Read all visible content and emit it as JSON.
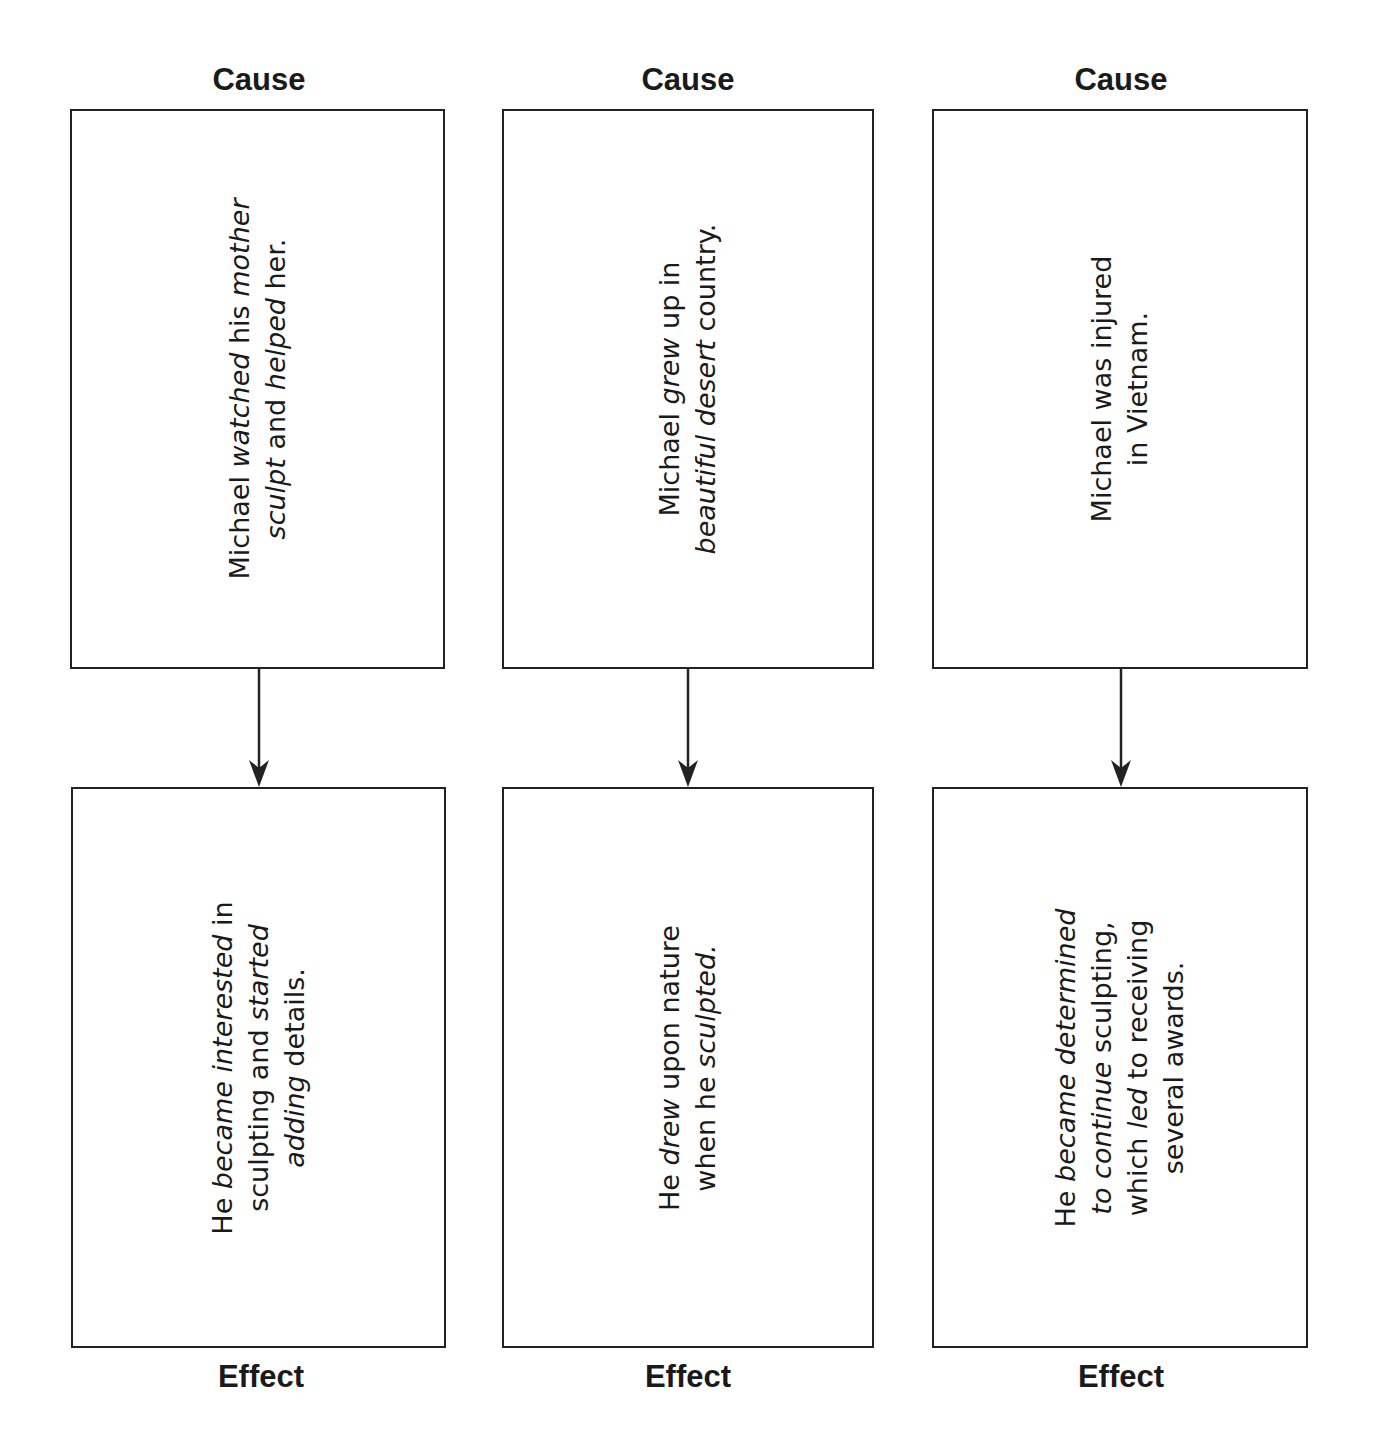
{
  "diagram": {
    "type": "cause-effect-chart",
    "columns": [
      {
        "cause_label": "Cause",
        "effect_label": "Effect",
        "cause": {
          "lines": [
            [
              {
                "t": "Michael "
              },
              {
                "t": "watched",
                "i": true
              },
              {
                "t": " his "
              },
              {
                "t": "mother",
                "i": true
              }
            ],
            [
              {
                "t": "sculpt",
                "i": true
              },
              {
                "t": " and "
              },
              {
                "t": "helped",
                "i": true
              },
              {
                "t": " her."
              }
            ]
          ],
          "text": "Michael watched his mother sculpt and helped her."
        },
        "effect": {
          "lines": [
            [
              {
                "t": "He "
              },
              {
                "t": "became",
                "i": true
              },
              {
                "t": " "
              },
              {
                "t": "interested",
                "i": true
              },
              {
                "t": " in"
              }
            ],
            [
              {
                "t": "sculpting and "
              },
              {
                "t": "started",
                "i": true
              }
            ],
            [
              {
                "t": "adding",
                "i": true
              },
              {
                "t": " details."
              }
            ]
          ],
          "text": "He became interested in sculpting and started adding details."
        }
      },
      {
        "cause_label": "Cause",
        "effect_label": "Effect",
        "cause": {
          "lines": [
            [
              {
                "t": "Michael "
              },
              {
                "t": "grew",
                "i": true
              },
              {
                "t": " up in"
              }
            ],
            [
              {
                "t": "beautiful",
                "i": true
              },
              {
                "t": " "
              },
              {
                "t": "desert",
                "i": true
              },
              {
                "t": " country."
              }
            ]
          ],
          "text": "Michael grew up in beautiful desert country."
        },
        "effect": {
          "lines": [
            [
              {
                "t": "He "
              },
              {
                "t": "drew",
                "i": true
              },
              {
                "t": " upon nature"
              }
            ],
            [
              {
                "t": "when he "
              },
              {
                "t": "sculpted.",
                "i": true
              }
            ]
          ],
          "text": "He drew upon nature when he sculpted."
        }
      },
      {
        "cause_label": "Cause",
        "effect_label": "Effect",
        "cause": {
          "lines": [
            [
              {
                "t": "Michael was injured"
              }
            ],
            [
              {
                "t": "in Vietnam."
              }
            ]
          ],
          "text": "Michael was injured in Vietnam."
        },
        "effect": {
          "lines": [
            [
              {
                "t": "He "
              },
              {
                "t": "became",
                "i": true
              },
              {
                "t": " "
              },
              {
                "t": "determined",
                "i": true
              }
            ],
            [
              {
                "t": "to continue",
                "i": true
              },
              {
                "t": " sculpting,"
              }
            ],
            [
              {
                "t": "which "
              },
              {
                "t": "led",
                "i": true
              },
              {
                "t": " to receiving"
              }
            ],
            [
              {
                "t": "several awards."
              }
            ]
          ],
          "text": "He became determined to continue sculpting, which led to receiving several awards."
        }
      }
    ],
    "colors": {
      "line": "#222222",
      "text": "#1a1a1a",
      "background": "#ffffff"
    }
  }
}
